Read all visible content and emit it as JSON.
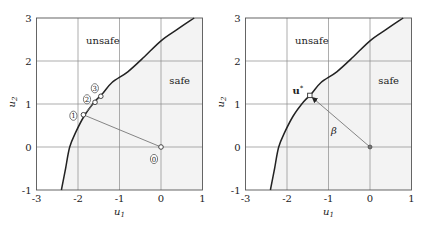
{
  "chart_data": [
    {
      "type": "line",
      "panel": "left",
      "title": "",
      "xlabel": "u1",
      "ylabel": "u2",
      "xlim": [
        -3,
        1
      ],
      "ylim": [
        -1,
        3
      ],
      "xticks": [
        "-3",
        "-2",
        "-1",
        "0",
        "1"
      ],
      "yticks": [
        "-1",
        "0",
        "1",
        "2",
        "3"
      ],
      "grid": true,
      "regions": [
        {
          "label": "unsafe",
          "x": -1.4,
          "y": 2.5
        },
        {
          "label": "safe",
          "x": 0.45,
          "y": 1.55
        }
      ],
      "limit_state_curve": {
        "x": [
          -2.4,
          -2.3,
          -2.2,
          -2.05,
          -1.85,
          -1.6,
          -1.4,
          -1.18,
          -0.8,
          -0.4,
          0.0,
          0.4,
          0.8
        ],
        "y": [
          -1.0,
          -0.5,
          0.0,
          0.35,
          0.72,
          1.05,
          1.25,
          1.5,
          1.75,
          2.1,
          2.47,
          2.74,
          3.0
        ]
      },
      "iteration_points": [
        {
          "label": "0",
          "x": 0.0,
          "y": 0.0
        },
        {
          "label": "1",
          "x": -1.87,
          "y": 0.75
        },
        {
          "label": "2",
          "x": -1.59,
          "y": 1.04
        },
        {
          "label": "3",
          "x": -1.45,
          "y": 1.18
        }
      ]
    },
    {
      "type": "line",
      "panel": "right",
      "title": "",
      "xlabel": "u1",
      "ylabel": "u2",
      "xlim": [
        -3,
        1
      ],
      "ylim": [
        -1,
        3
      ],
      "xticks": [
        "-3",
        "-2",
        "-1",
        "0",
        "1"
      ],
      "yticks": [
        "-1",
        "0",
        "1",
        "2",
        "3"
      ],
      "grid": true,
      "regions": [
        {
          "label": "unsafe",
          "x": -1.4,
          "y": 2.5
        },
        {
          "label": "safe",
          "x": 0.45,
          "y": 1.55
        }
      ],
      "limit_state_curve": {
        "x": [
          -2.4,
          -2.3,
          -2.2,
          -2.05,
          -1.85,
          -1.6,
          -1.4,
          -1.18,
          -0.8,
          -0.4,
          0.0,
          0.4,
          0.8
        ],
        "y": [
          -1.0,
          -0.5,
          0.0,
          0.35,
          0.72,
          1.05,
          1.25,
          1.5,
          1.75,
          2.1,
          2.47,
          2.74,
          3.0
        ]
      },
      "design_point": {
        "label": "u*",
        "x": -1.45,
        "y": 1.2
      },
      "origin": {
        "x": 0.0,
        "y": 0.0
      },
      "reliability_index_label": "β"
    }
  ],
  "panels": {
    "left": {
      "xlabel": "u₁",
      "ylabel": "u₂",
      "region_unsafe": "unsafe",
      "region_safe": "safe",
      "point_labels": [
        "0",
        "1",
        "2",
        "3"
      ]
    },
    "right": {
      "xlabel": "u₁",
      "ylabel": "u₂",
      "region_unsafe": "unsafe",
      "region_safe": "safe",
      "design_point_label": "u*",
      "beta_label": "β"
    }
  },
  "colors": {
    "axes": "#555555",
    "grid": "#8a8a8a",
    "curve": "#222222",
    "safe_fill": "#f3f3f3",
    "path_line": "#777777"
  }
}
